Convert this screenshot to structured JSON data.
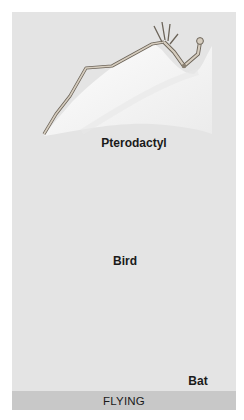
{
  "figure": {
    "title": "FLYING",
    "panels": [
      {
        "id": "pterodactyl",
        "label": "Pterodactyl"
      },
      {
        "id": "bird",
        "label": "Bird"
      },
      {
        "id": "bat",
        "label": "Bat"
      }
    ]
  },
  "colors": {
    "background": "#e4e4e4",
    "footer_bar": "#c8c8c8",
    "membrane": "#f4f4f2",
    "bone": "#cfc6b8",
    "bone_outline": "#6b6358",
    "text": "#1a1a1a"
  }
}
